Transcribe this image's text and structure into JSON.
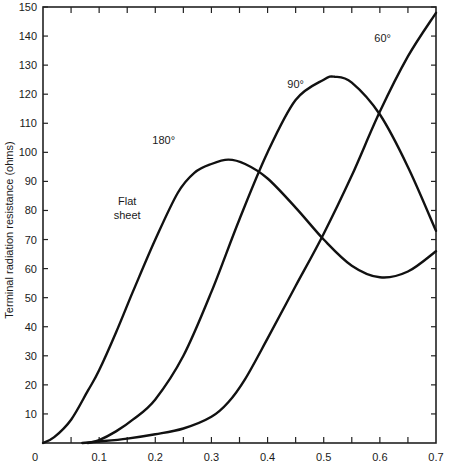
{
  "chart_data": {
    "type": "line",
    "title": "",
    "xlabel": "",
    "ylabel": "Terminal radiation resistance (ohms)",
    "xlim": [
      0,
      0.7
    ],
    "ylim": [
      0,
      150
    ],
    "grid": false,
    "legend": "none (curves labeled inline)",
    "x_ticks": [
      "0",
      "0.1",
      "0.2",
      "0.3",
      "0.4",
      "0.5",
      "0.6",
      "0.7"
    ],
    "y_ticks": [
      "10",
      "20",
      "30",
      "40",
      "50",
      "60",
      "70",
      "80",
      "90",
      "100",
      "110",
      "120",
      "130",
      "140",
      "150"
    ],
    "annotations": [
      {
        "text": "180°",
        "x": 0.215,
        "y": 103
      },
      {
        "text": "Flat",
        "x": 0.15,
        "y": 82
      },
      {
        "text": "sheet",
        "x": 0.15,
        "y": 77
      },
      {
        "text": "90°",
        "x": 0.45,
        "y": 122
      },
      {
        "text": "60°",
        "x": 0.605,
        "y": 138
      }
    ],
    "series": [
      {
        "name": "180° (Flat sheet)",
        "x": [
          0,
          0.02,
          0.05,
          0.08,
          0.1,
          0.13,
          0.16,
          0.2,
          0.24,
          0.27,
          0.3,
          0.33,
          0.36,
          0.4,
          0.45,
          0.5,
          0.55,
          0.6,
          0.65,
          0.7
        ],
        "values": [
          0,
          2,
          8,
          18,
          25,
          38,
          52,
          70,
          86,
          93,
          96,
          97.5,
          96,
          91,
          81,
          70,
          61,
          57,
          59,
          66
        ]
      },
      {
        "name": "90°",
        "x": [
          0.08,
          0.1,
          0.13,
          0.16,
          0.2,
          0.25,
          0.3,
          0.35,
          0.4,
          0.45,
          0.5,
          0.52,
          0.55,
          0.6,
          0.65,
          0.7
        ],
        "values": [
          0,
          1,
          4,
          8,
          15,
          30,
          52,
          77,
          100,
          118,
          125,
          126,
          124,
          113,
          95,
          73
        ]
      },
      {
        "name": "60°",
        "x": [
          0.07,
          0.1,
          0.15,
          0.2,
          0.25,
          0.3,
          0.33,
          0.36,
          0.4,
          0.45,
          0.5,
          0.55,
          0.6,
          0.65,
          0.7
        ],
        "values": [
          0,
          0.5,
          1.5,
          3,
          5,
          9,
          14,
          22,
          36,
          54,
          72,
          92,
          114,
          133,
          148
        ]
      }
    ]
  }
}
